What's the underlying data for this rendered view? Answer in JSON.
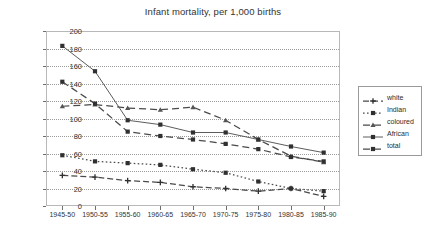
{
  "chart": {
    "title": "Infant mortality, per 1,000 births",
    "legend_position": "right"
  },
  "axes": {
    "y_ticks": [
      "0",
      "20",
      "40",
      "60",
      "80",
      "100",
      "120",
      "140",
      "160",
      "180",
      "200"
    ],
    "x_ticks": [
      "1945-50",
      "1950-55",
      "1955-60",
      "1960-65",
      "1965-70",
      "1970-75",
      "1975-80",
      "1980-85",
      "1985-90"
    ]
  },
  "legend": {
    "items": [
      {
        "label": "white",
        "marker": "plus-marker",
        "dash": "6,3"
      },
      {
        "label": "Indian",
        "marker": "square-marker",
        "dash": "1.6,2.4"
      },
      {
        "label": "coloured",
        "marker": "triangle-marker",
        "dash": "7,4"
      },
      {
        "label": "African",
        "marker": "square-marker",
        "dash": "none"
      },
      {
        "label": "total",
        "marker": "square-marker",
        "dash": "7,4"
      }
    ]
  },
  "chart_data": {
    "type": "line",
    "title": "Infant mortality, per 1,000 births",
    "xlabel": "",
    "ylabel": "",
    "ylim": [
      0,
      200
    ],
    "ytick_step": 20,
    "grid": true,
    "legend_position": "right",
    "categories": [
      "1945-50",
      "1950-55",
      "1955-60",
      "1960-65",
      "1965-70",
      "1970-75",
      "1975-80",
      "1980-85",
      "1985-90"
    ],
    "series": [
      {
        "name": "white",
        "values": [
          35,
          33,
          29,
          27,
          22,
          20,
          17,
          20,
          11
        ]
      },
      {
        "name": "Indian",
        "values": [
          58,
          51,
          49,
          47,
          42,
          38,
          28,
          20,
          17
        ]
      },
      {
        "name": "coloured",
        "values": [
          114,
          116,
          112,
          110,
          113,
          98,
          76,
          57,
          50
        ]
      },
      {
        "name": "African",
        "values": [
          183,
          154,
          98,
          93,
          84,
          84,
          76,
          68,
          61
        ]
      },
      {
        "name": "total",
        "values": [
          142,
          117,
          85,
          80,
          76,
          71,
          65,
          56,
          51
        ]
      }
    ]
  }
}
